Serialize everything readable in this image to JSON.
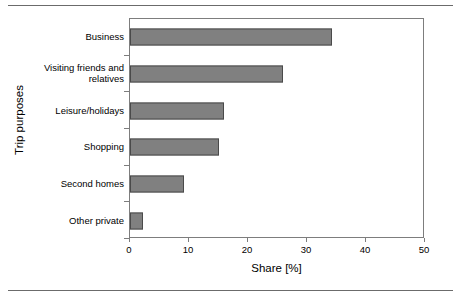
{
  "chart_data": {
    "type": "bar",
    "orientation": "horizontal",
    "title": "",
    "xlabel": "Share [%]",
    "ylabel": "Trip purposes",
    "categories": [
      "Business",
      "Visiting friends and relatives",
      "Leisure/holidays",
      "Shopping",
      "Second homes",
      "Other private"
    ],
    "category_lines": [
      [
        "Business"
      ],
      [
        "Visiting friends and",
        "relatives"
      ],
      [
        "Leisure/holidays"
      ],
      [
        "Shopping"
      ],
      [
        "Second homes"
      ],
      [
        "Other private"
      ]
    ],
    "values": [
      34.3,
      26.0,
      16.0,
      15.0,
      9.2,
      2.2
    ],
    "xlim": [
      0,
      50
    ],
    "xticks": [
      0,
      10,
      20,
      30,
      40,
      50
    ],
    "xtick_labels": [
      "0",
      "10",
      "20",
      "30",
      "40",
      "50"
    ],
    "grid": false,
    "legend": null,
    "bar_color": "#808080",
    "bar_edge_color": "#4a4a4a",
    "axis_color": "#7d7d7d",
    "background_color": "#ffffff"
  },
  "figure": {
    "top_rule": "",
    "bottom_rule": ""
  }
}
